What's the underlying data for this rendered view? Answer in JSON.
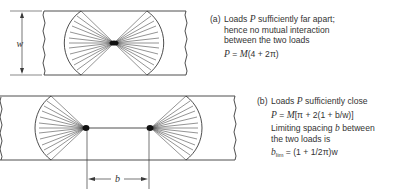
{
  "figure": {
    "dimension_labels": {
      "width": "w",
      "spacing": "b"
    },
    "case_a": {
      "tag": "(a)",
      "lines": [
        "Loads P sufficiently far apart;",
        "hence no mutual interaction",
        "between the two loads"
      ],
      "line1_pre": "Loads ",
      "line1_var": "P",
      "line1_post": " sufficiently far apart;",
      "line2": "hence no mutual interaction",
      "line3": "between the two loads",
      "formula": "P = M(4 + 2π)",
      "formula_lhs": "P",
      "formula_eq": " = ",
      "formula_m": "M",
      "formula_rest": "(4 + 2π)"
    },
    "case_b": {
      "tag": "(b)",
      "line1_pre": "Loads ",
      "line1_var": "P",
      "line1_post": " sufficiently close",
      "formula": "P = M[π + 2(1 + b/w)]",
      "formula_lhs": "P",
      "formula_eq": " = ",
      "formula_m": "M",
      "formula_rest": "[π + 2(1 + b/w)]",
      "limit_pre": "Limiting spacing ",
      "limit_var": "b",
      "limit_post": " between",
      "limit_line2": "the two loads is",
      "blim_var": "b",
      "blim_sub": "lim",
      "blim_rest": " = (1 + 1/2π)w"
    }
  },
  "colors": {
    "line": "#3a3a3a",
    "load": "#111111"
  }
}
